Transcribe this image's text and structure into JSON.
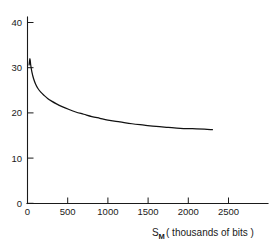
{
  "chart_data": {
    "type": "line",
    "title": "",
    "subtitle": "",
    "xlabel": "S_M ( thousands of bits )",
    "xlabel_main": "S",
    "xlabel_sub": "M",
    "xlabel_rest": "( thousands of bits )",
    "ylabel": "",
    "xlim": [
      0,
      2700
    ],
    "ylim": [
      0,
      43
    ],
    "xticks": [
      0,
      500,
      1000,
      1500,
      2000,
      2500
    ],
    "xtick_labels": [
      "0",
      "500",
      "1000",
      "1500",
      "2000",
      "2500"
    ],
    "yticks": [
      0,
      10,
      20,
      30,
      40
    ],
    "ytick_labels": [
      "0",
      "10",
      "20",
      "30",
      "40"
    ],
    "grid": false,
    "legend": null,
    "legend_position": "none",
    "line_color": "#111111",
    "axis_color": "#1a1a1a",
    "background_color": "#ffffff",
    "series": [
      {
        "name": "curve",
        "x": [
          20,
          30,
          40,
          55,
          75,
          100,
          130,
          165,
          205,
          250,
          300,
          360,
          430,
          510,
          600,
          700,
          800,
          900,
          1000,
          1150,
          1300,
          1450,
          1600,
          1750,
          1900,
          2050,
          2200,
          2300
        ],
        "values": [
          30.6,
          32.0,
          30.6,
          29.0,
          27.6,
          26.4,
          25.4,
          24.6,
          23.9,
          23.2,
          22.6,
          22.0,
          21.4,
          20.8,
          20.2,
          19.7,
          19.2,
          18.8,
          18.4,
          18.0,
          17.6,
          17.3,
          17.0,
          16.8,
          16.6,
          16.5,
          16.4,
          16.3
        ]
      }
    ],
    "annotations": []
  }
}
